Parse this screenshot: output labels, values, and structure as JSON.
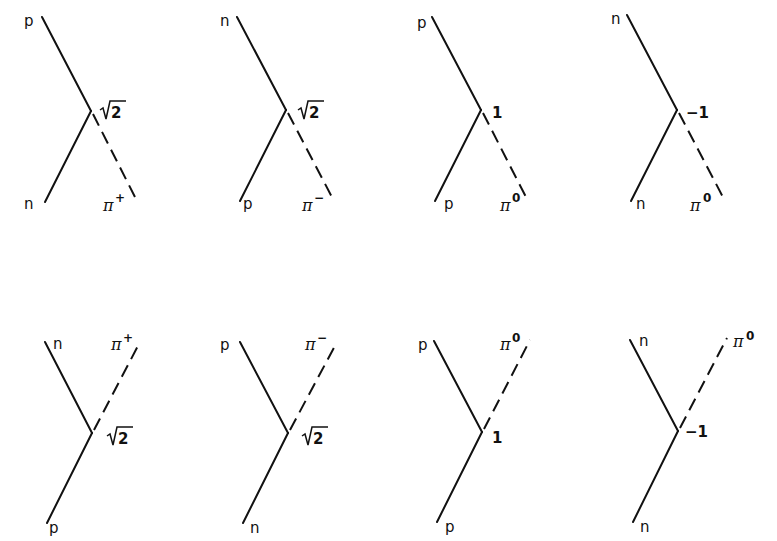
{
  "diagram": {
    "type": "pion-nucleon vertex diagrams",
    "rows": 2,
    "columns": 4,
    "vertices": [
      {
        "id": 1,
        "row": "top",
        "nucleon_in": "p",
        "nucleon_out": "n",
        "pion": "π",
        "pion_charge": "+",
        "coupling": "√2",
        "coupling_radicand": "2"
      },
      {
        "id": 2,
        "row": "top",
        "nucleon_in": "n",
        "nucleon_out": "p",
        "pion": "π",
        "pion_charge": "−",
        "coupling": "√2",
        "coupling_radicand": "2"
      },
      {
        "id": 3,
        "row": "top",
        "nucleon_in": "p",
        "nucleon_out": "p",
        "pion": "π",
        "pion_charge": "0",
        "coupling": "1"
      },
      {
        "id": 4,
        "row": "top",
        "nucleon_in": "n",
        "nucleon_out": "n",
        "pion": "π",
        "pion_charge": "0",
        "coupling": "−1"
      },
      {
        "id": 5,
        "row": "bottom",
        "nucleon_in": "p",
        "nucleon_out": "n",
        "pion": "π",
        "pion_charge": "+",
        "coupling": "√2",
        "coupling_radicand": "2"
      },
      {
        "id": 6,
        "row": "bottom",
        "nucleon_in": "n",
        "nucleon_out": "p",
        "pion": "π",
        "pion_charge": "−",
        "coupling": "√2",
        "coupling_radicand": "2"
      },
      {
        "id": 7,
        "row": "bottom",
        "nucleon_in": "p",
        "nucleon_out": "p",
        "pion": "π",
        "pion_charge": "0",
        "coupling": "1"
      },
      {
        "id": 8,
        "row": "bottom",
        "nucleon_in": "n",
        "nucleon_out": "n",
        "pion": "π",
        "pion_charge": "0",
        "coupling": "−1"
      }
    ]
  },
  "labels": {
    "d1": {
      "top": "p",
      "bottom": "n",
      "pion": "π",
      "charge": "+",
      "coupling_num": "2"
    },
    "d2": {
      "top": "n",
      "bottom": "p",
      "pion": "π",
      "charge": "−",
      "coupling_num": "2"
    },
    "d3": {
      "top": "p",
      "bottom": "p",
      "pion": "π",
      "charge": "0",
      "coupling": "1"
    },
    "d4": {
      "top": "n",
      "bottom": "n",
      "pion": "π",
      "charge": "0",
      "coupling": "−1"
    },
    "d5": {
      "top": "n",
      "bottom": "p",
      "pion": "π",
      "charge": "+",
      "coupling_num": "2"
    },
    "d6": {
      "top": "p",
      "bottom": "n",
      "pion": "π",
      "charge": "−",
      "coupling_num": "2"
    },
    "d7": {
      "top": "p",
      "bottom": "p",
      "pion": "π",
      "charge": "0",
      "coupling": "1"
    },
    "d8": {
      "top": "n",
      "bottom": "n",
      "pion": "π",
      "charge": "0",
      "coupling": "−1"
    }
  },
  "colors": {
    "line": "#111111",
    "background": "#ffffff"
  }
}
